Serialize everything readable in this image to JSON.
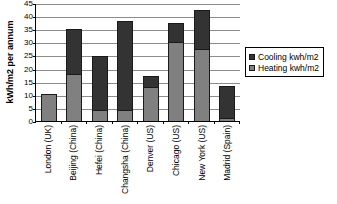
{
  "chart_data": {
    "type": "bar",
    "subtype": "stacked-column",
    "title": "",
    "xlabel": "",
    "ylabel": "kWh/m2 per annum",
    "ylim": [
      0,
      45
    ],
    "ytick_step": 5,
    "yticks": [
      "45",
      "40",
      "35",
      "30",
      "25",
      "20",
      "15",
      "10",
      "5",
      "0"
    ],
    "grid": true,
    "legend_position": "right",
    "categories": [
      "London (UK)",
      "Beijing (China)",
      "Hefei (China)",
      "Changsha (China)",
      "Denver (US)",
      "Chicago (US)",
      "New York (US)",
      "Madrid (Spain)"
    ],
    "series": [
      {
        "name": "Heating kwh/m2",
        "color": "#808080",
        "values": [
          10.3,
          17.8,
          4.1,
          4.1,
          13.0,
          30.0,
          27.5,
          1.0
        ]
      },
      {
        "name": "Cooling kwh/m2",
        "color": "#333333",
        "values": [
          0,
          17.2,
          20.7,
          34.1,
          4.2,
          7.3,
          15.0,
          12.2
        ]
      }
    ],
    "totals": [
      10.3,
      35.0,
      24.8,
      38.2,
      17.2,
      37.3,
      42.5,
      13.2
    ]
  },
  "legend": {
    "items": [
      {
        "label": "Cooling kwh/m2",
        "swatch": "cooling"
      },
      {
        "label": "Heating kwh/m2",
        "swatch": "heating"
      }
    ]
  },
  "colors": {
    "heating": "#808080",
    "cooling": "#333333",
    "axis": "#000000",
    "gridline": "#8c8c8c",
    "background": "#ffffff"
  }
}
